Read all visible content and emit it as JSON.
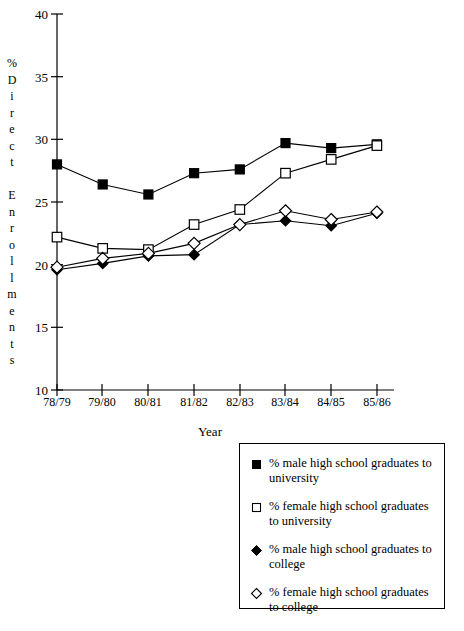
{
  "chart_data": {
    "type": "line",
    "title": "",
    "xlabel": "Year",
    "ylabel": "% Direct Enrollments",
    "categories": [
      "78/79",
      "79/80",
      "80/81",
      "81/82",
      "82/83",
      "83/84",
      "84/85",
      "85/86"
    ],
    "ylim": [
      10,
      40
    ],
    "yticks": [
      10,
      15,
      20,
      25,
      30,
      35,
      40
    ],
    "grid": false,
    "legend_position": "below-right",
    "series": [
      {
        "name": "% male high school graduates to university",
        "marker": "filled-square",
        "values": [
          28.0,
          26.4,
          25.6,
          27.3,
          27.6,
          29.7,
          29.3,
          29.6
        ]
      },
      {
        "name": "% female high school graduates to university",
        "marker": "open-square",
        "values": [
          22.2,
          21.3,
          21.2,
          23.2,
          24.4,
          27.3,
          28.4,
          29.5
        ]
      },
      {
        "name": "% male high school graduates to college",
        "marker": "filled-diamond",
        "values": [
          19.6,
          20.1,
          20.7,
          20.8,
          23.2,
          23.5,
          23.1,
          24.1
        ]
      },
      {
        "name": "% female high school graduates to college",
        "marker": "open-diamond",
        "values": [
          19.8,
          20.5,
          20.9,
          21.7,
          23.2,
          24.3,
          23.6,
          24.2
        ]
      }
    ]
  },
  "yaxis": {
    "title_letters": [
      "%",
      "D",
      "i",
      "r",
      "e",
      "c",
      "t",
      "",
      "E",
      "n",
      "r",
      "o",
      "l",
      "l",
      "m",
      "e",
      "n",
      "t",
      "s"
    ],
    "tick_labels": [
      "40",
      "35",
      "30",
      "25",
      "20",
      "15",
      "10"
    ]
  },
  "xaxis": {
    "title": "Year",
    "tick_labels": [
      "78/79",
      "79/80",
      "80/81",
      "81/82",
      "82/83",
      "83/84",
      "84/85",
      "85/86"
    ]
  },
  "legend": {
    "items": [
      {
        "marker": "filled-square",
        "label": "% male high school graduates to university"
      },
      {
        "marker": "open-square",
        "label": "% female high school graduates to university"
      },
      {
        "marker": "filled-diamond",
        "label": "% male high school graduates to college"
      },
      {
        "marker": "open-diamond",
        "label": "% female high school graduates to college"
      }
    ]
  },
  "colors": {
    "line": "#000000",
    "background": "#ffffff",
    "axis": "#000000"
  }
}
